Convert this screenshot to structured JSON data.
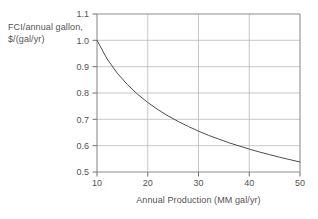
{
  "chart_data": {
    "type": "line",
    "title": "",
    "subtitle": "",
    "xlabel": "Annual Production (MM gal/yr)",
    "ylabel": "FCI/annual gallon, $/(gal/yr)",
    "ylabel_line1": "FCI/annual gallon,",
    "ylabel_line2": "$/(gal/yr)",
    "xlim": [
      10,
      50
    ],
    "ylim": [
      0.5,
      1.1
    ],
    "xticks": [
      10,
      20,
      30,
      40,
      50
    ],
    "yticks": [
      0.5,
      0.6,
      0.7,
      0.8,
      0.9,
      1.0,
      1.1
    ],
    "xtick_labels": [
      "10",
      "20",
      "30",
      "40",
      "50"
    ],
    "ytick_labels": [
      "0.5",
      "0.6",
      "0.7",
      "0.8",
      "0.9",
      "1.0",
      "1.1"
    ],
    "grid": true,
    "grid_color": "#b9b9b9",
    "legend": false,
    "legend_position": "none",
    "line_color": "#4d4d4d",
    "series": [
      {
        "name": "FCI per annual gallon",
        "x": [
          10,
          12,
          14,
          16,
          18,
          20,
          22,
          24,
          26,
          28,
          30,
          32,
          34,
          36,
          38,
          40,
          42,
          44,
          46,
          48,
          50
        ],
        "values": [
          1.0,
          0.929,
          0.875,
          0.832,
          0.795,
          0.764,
          0.737,
          0.713,
          0.692,
          0.673,
          0.655,
          0.639,
          0.625,
          0.611,
          0.599,
          0.587,
          0.576,
          0.566,
          0.556,
          0.547,
          0.538
        ]
      }
    ],
    "annotations": []
  },
  "axis": {
    "y_tick_0": "1.1",
    "y_tick_1": "1.0",
    "y_tick_2": "0.9",
    "y_tick_3": "0.8",
    "y_tick_4": "0.7",
    "y_tick_5": "0.6",
    "y_tick_6": "0.5",
    "x_tick_0": "10",
    "x_tick_1": "20",
    "x_tick_2": "30",
    "x_tick_3": "40",
    "x_tick_4": "50"
  }
}
